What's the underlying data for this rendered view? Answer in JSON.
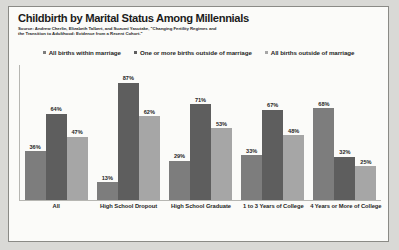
{
  "title": "Childbirth by Marital Status Among Millennials",
  "source": "Source: Andrew Cherlin, Elizabeth Talbert, and Suzumi Yasutake, \"Changing Fertility Regimes and the Transition to Adulthood: Evidence from a Recent Cohort.\"",
  "colors": {
    "series_1": "#7d7d7d",
    "series_2": "#5e5e5e",
    "series_3": "#a6a6a6",
    "page_background": "#fbfbf9",
    "outer_background": "#d9d9d6",
    "border": "#8a8a86",
    "axis": "#b6b6b2",
    "text": "#1f1f1f"
  },
  "chart_data": {
    "type": "bar",
    "title": "Childbirth by Marital Status Among Millennials",
    "subtitle": "Source: Andrew Cherlin, Elizabeth Talbert, and Suzumi Yasutake, \"Changing Fertility Regimes and the Transition to Adulthood: Evidence from a Recent Cohort.\"",
    "xlabel": "",
    "ylabel": "",
    "ylim": [
      0,
      100
    ],
    "grid": false,
    "legend_position": "top-center",
    "value_labels": true,
    "value_suffix": "%",
    "categories": [
      "All",
      "High School Dropout",
      "High School Graduate",
      "1 to 3 Years of College",
      "4 Years or More of College"
    ],
    "series": [
      {
        "name": "All births within marriage",
        "color": "#7d7d7d",
        "values": [
          36,
          13,
          29,
          33,
          68
        ],
        "labels": [
          "36%",
          "13%",
          "29%",
          "33%",
          "68%"
        ]
      },
      {
        "name": "One or more births outside of marriage",
        "color": "#5e5e5e",
        "values": [
          64,
          87,
          71,
          67,
          32
        ],
        "labels": [
          "64%",
          "87%",
          "71%",
          "67%",
          "32%"
        ]
      },
      {
        "name": "All births outside of marriage",
        "color": "#a6a6a6",
        "values": [
          47,
          62,
          53,
          48,
          25
        ],
        "labels": [
          "47%",
          "62%",
          "53%",
          "48%",
          "25%"
        ]
      }
    ]
  }
}
